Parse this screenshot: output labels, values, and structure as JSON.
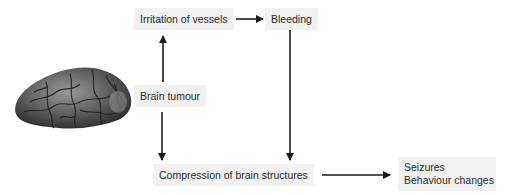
{
  "nodes": {
    "irritation": {
      "label": "Irritation of vessels"
    },
    "bleeding": {
      "label": "Bleeding"
    },
    "tumour": {
      "label": "Brain tumour"
    },
    "compression": {
      "label": "Compression of brain structures"
    },
    "outcomes": {
      "lines": [
        "Seizures",
        "Behaviour changes"
      ]
    }
  },
  "image": {
    "subject": "brain-illustration"
  },
  "edges": [
    {
      "from": "tumour",
      "to": "irritation"
    },
    {
      "from": "irritation",
      "to": "bleeding"
    },
    {
      "from": "bleeding",
      "to": "compression"
    },
    {
      "from": "tumour",
      "to": "compression"
    },
    {
      "from": "compression",
      "to": "outcomes"
    }
  ],
  "colors": {
    "box_fill": "#f1f1f1",
    "arrow": "#1a1a1a",
    "text": "#2a2a2a"
  }
}
